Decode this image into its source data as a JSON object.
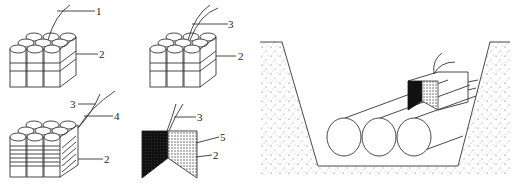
{
  "figure": {
    "panels": [
      {
        "id": "a",
        "labels": [
          "1",
          "2"
        ],
        "description": "bundle of cylinders with cable 1 and binding 2"
      },
      {
        "id": "b",
        "labels": [
          "3",
          "2"
        ],
        "description": "bundle of cylinders with cable 3 and binding 2"
      },
      {
        "id": "c",
        "labels": [
          "3",
          "4",
          "2"
        ],
        "description": "bundle with wrapped layer 4 and binding 2"
      },
      {
        "id": "d",
        "labels": [
          "3",
          "5",
          "2"
        ],
        "description": "section with dark and dotted halves"
      },
      {
        "id": "e",
        "labels": [],
        "description": "trench with three pipes and block on top"
      }
    ]
  },
  "colors": {
    "stroke": "#333333",
    "dark_fill": "#111111",
    "background": "#ffffff"
  }
}
